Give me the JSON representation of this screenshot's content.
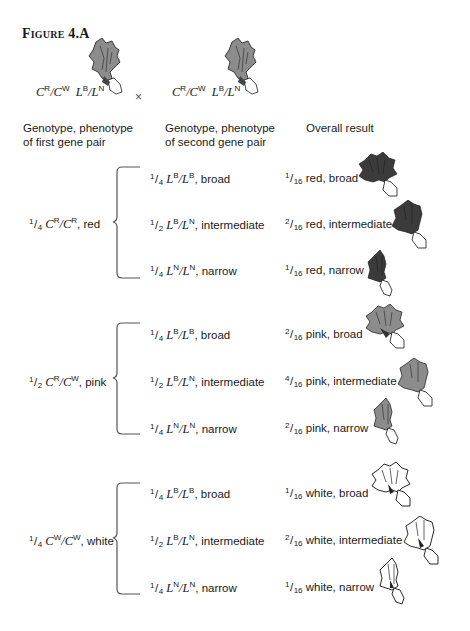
{
  "figure": {
    "title": "Figure 4.A"
  },
  "parents": {
    "cross_symbol": "×",
    "parent1": {
      "genotype_parts": [
        "C",
        "R",
        "/C",
        "W",
        " L",
        "B",
        "/L",
        "N"
      ],
      "flower_color": "pink",
      "leaf": "intermediate"
    },
    "parent2": {
      "genotype_parts": [
        "C",
        "R",
        "/C",
        "W",
        " L",
        "B",
        "/L",
        "N"
      ],
      "flower_color": "pink",
      "leaf": "intermediate"
    }
  },
  "headers": {
    "col1_line1": "Genotype, phenotype",
    "col1_line2": "of first gene pair",
    "col2_line1": "Genotype, phenotype",
    "col2_line2": "of second gene pair",
    "col3": "Overall result"
  },
  "colors": {
    "red_flower": "#3b3b3b",
    "pink_flower": "#8c8c8c",
    "white_flower": "#ffffff",
    "outline": "#1a1a1a",
    "brace": "#555555"
  },
  "groups": [
    {
      "first": {
        "num": "1",
        "den": "4",
        "allele1": "C",
        "sup1": "R",
        "allele2": "/C",
        "sup2": "R",
        "phenotype": ", red"
      },
      "rows": [
        {
          "second": {
            "num": "1",
            "den": "4",
            "a1": "L",
            "s1": "B",
            "a2": "/L",
            "s2": "B",
            "phen": ", broad"
          },
          "result": {
            "num": "1",
            "den": "16",
            "text": " red, broad"
          }
        },
        {
          "second": {
            "num": "1",
            "den": "2",
            "a1": "L",
            "s1": "B",
            "a2": "/L",
            "s2": "N",
            "phen": ", intermediate"
          },
          "result": {
            "num": "2",
            "den": "16",
            "text": " red, intermediate"
          }
        },
        {
          "second": {
            "num": "1",
            "den": "4",
            "a1": "L",
            "s1": "N",
            "a2": "/L",
            "s2": "N",
            "phen": ", narrow"
          },
          "result": {
            "num": "1",
            "den": "16",
            "text": " red, narrow"
          }
        }
      ]
    },
    {
      "first": {
        "num": "1",
        "den": "2",
        "allele1": "C",
        "sup1": "R",
        "allele2": "/C",
        "sup2": "W",
        "phenotype": ", pink"
      },
      "rows": [
        {
          "second": {
            "num": "1",
            "den": "4",
            "a1": "L",
            "s1": "B",
            "a2": "/L",
            "s2": "B",
            "phen": ", broad"
          },
          "result": {
            "num": "2",
            "den": "16",
            "text": " pink, broad"
          }
        },
        {
          "second": {
            "num": "1",
            "den": "2",
            "a1": "L",
            "s1": "B",
            "a2": "/L",
            "s2": "N",
            "phen": ", intermediate"
          },
          "result": {
            "num": "4",
            "den": "16",
            "text": " pink, intermediate"
          }
        },
        {
          "second": {
            "num": "1",
            "den": "4",
            "a1": "L",
            "s1": "N",
            "a2": "/L",
            "s2": "N",
            "phen": ", narrow"
          },
          "result": {
            "num": "2",
            "den": "16",
            "text": " pink, narrow"
          }
        }
      ]
    },
    {
      "first": {
        "num": "1",
        "den": "4",
        "allele1": "C",
        "sup1": "W",
        "allele2": "/C",
        "sup2": "W",
        "phenotype": ", white"
      },
      "rows": [
        {
          "second": {
            "num": "1",
            "den": "4",
            "a1": "L",
            "s1": "B",
            "a2": "/L",
            "s2": "B",
            "phen": ", broad"
          },
          "result": {
            "num": "1",
            "den": "16",
            "text": " white, broad"
          }
        },
        {
          "second": {
            "num": "1",
            "den": "2",
            "a1": "L",
            "s1": "B",
            "a2": "/L",
            "s2": "N",
            "phen": ", intermediate"
          },
          "result": {
            "num": "2",
            "den": "16",
            "text": " white, intermediate"
          }
        },
        {
          "second": {
            "num": "1",
            "den": "4",
            "a1": "L",
            "s1": "N",
            "a2": "/L",
            "s2": "N",
            "phen": ", narrow"
          },
          "result": {
            "num": "1",
            "den": "16",
            "text": " white, narrow"
          }
        }
      ]
    }
  ]
}
